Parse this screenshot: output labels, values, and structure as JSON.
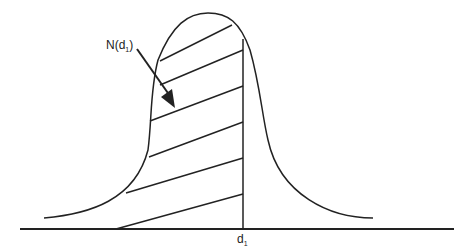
{
  "diagram": {
    "area_label": {
      "main": "N(d",
      "sub": "1",
      "close": ")"
    },
    "axis_label": {
      "main": "d",
      "sub": "1"
    },
    "colors": {
      "line": "#222222",
      "background": "#ffffff"
    }
  }
}
